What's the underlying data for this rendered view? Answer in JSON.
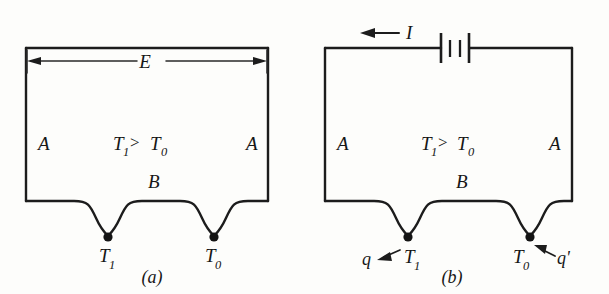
{
  "figure": {
    "background_color": "#fdfdfb",
    "ink_color": "#1c1c1c",
    "panels": [
      {
        "id": "a",
        "caption": "(a)",
        "description": "Open thermocouple circuit showing thermoelectric emf E between two junctions",
        "labels": {
          "emf": "E",
          "conductor_left": "A",
          "conductor_right": "A",
          "conductor_bottom": "B",
          "relation_left": "T",
          "relation_left_sub": "1",
          "relation_operator": ">",
          "relation_right": "T",
          "relation_right_sub": "0",
          "junction_hot": "T",
          "junction_hot_sub": "1",
          "junction_cold": "T",
          "junction_cold_sub": "0"
        }
      },
      {
        "id": "b",
        "caption": "(b)",
        "description": "Thermocouple circuit driven by a battery, with current I and Peltier heats q and q' at the junctions",
        "labels": {
          "current": "I",
          "conductor_left": "A",
          "conductor_right": "A",
          "conductor_bottom": "B",
          "relation_left": "T",
          "relation_left_sub": "1",
          "relation_operator": ">",
          "relation_right": "T",
          "relation_right_sub": "0",
          "junction_hot": "T",
          "junction_hot_sub": "1",
          "junction_cold": "T",
          "junction_cold_sub": "0",
          "heat_hot": "q",
          "heat_cold": "q'",
          "battery": "battery-symbol"
        }
      }
    ]
  }
}
